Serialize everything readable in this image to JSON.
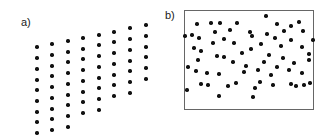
{
  "figure": {
    "width": 326,
    "height": 140,
    "background_color": "#ffffff",
    "dot_color": "#111111",
    "frame_color": "#666666",
    "label_color": "#1a1a1a"
  },
  "panels": {
    "a": {
      "label": "a)",
      "has_frame": false,
      "description": "regular sheared lattice point pattern"
    },
    "b": {
      "label": "b)",
      "has_frame": true,
      "description": "random Poisson point pattern inside rectangular frame"
    }
  },
  "chart_data": [
    {
      "type": "scatter",
      "title": "a)",
      "xlabel": "",
      "ylabel": "",
      "grid": false,
      "legend": null,
      "xlim": [
        0,
        163
      ],
      "ylim": [
        0,
        140
      ],
      "note": "regular lattice, sheared (parallelogram) arrangement, 8 columns x 9 rows clipped",
      "points": [
        [
          37,
          47
        ],
        [
          52,
          44
        ],
        [
          68,
          41
        ],
        [
          83,
          38
        ],
        [
          99,
          35
        ],
        [
          114,
          32
        ],
        [
          130,
          28
        ],
        [
          146,
          25
        ],
        [
          37,
          58
        ],
        [
          52,
          55
        ],
        [
          68,
          52
        ],
        [
          83,
          49
        ],
        [
          99,
          45
        ],
        [
          114,
          42
        ],
        [
          130,
          39
        ],
        [
          146,
          36
        ],
        [
          37,
          69
        ],
        [
          52,
          66
        ],
        [
          68,
          62
        ],
        [
          83,
          59
        ],
        [
          99,
          56
        ],
        [
          114,
          53
        ],
        [
          130,
          50
        ],
        [
          146,
          47
        ],
        [
          37,
          80
        ],
        [
          52,
          76
        ],
        [
          68,
          73
        ],
        [
          83,
          70
        ],
        [
          99,
          67
        ],
        [
          114,
          64
        ],
        [
          130,
          61
        ],
        [
          146,
          57
        ],
        [
          37,
          90
        ],
        [
          52,
          87
        ],
        [
          68,
          84
        ],
        [
          83,
          81
        ],
        [
          99,
          78
        ],
        [
          114,
          75
        ],
        [
          130,
          71
        ],
        [
          146,
          68
        ],
        [
          37,
          101
        ],
        [
          52,
          98
        ],
        [
          68,
          95
        ],
        [
          83,
          92
        ],
        [
          99,
          88
        ],
        [
          114,
          85
        ],
        [
          130,
          82
        ],
        [
          146,
          79
        ],
        [
          37,
          112
        ],
        [
          52,
          109
        ],
        [
          68,
          105
        ],
        [
          83,
          102
        ],
        [
          99,
          99
        ],
        [
          114,
          96
        ],
        [
          130,
          93
        ],
        [
          37,
          122
        ],
        [
          52,
          119
        ],
        [
          68,
          116
        ],
        [
          83,
          113
        ],
        [
          99,
          110
        ],
        [
          37,
          133
        ],
        [
          52,
          130
        ],
        [
          68,
          127
        ]
      ]
    },
    {
      "type": "scatter",
      "title": "b)",
      "xlabel": "",
      "ylabel": "",
      "grid": false,
      "legend": null,
      "xlim": [
        0,
        163
      ],
      "ylim": [
        0,
        140
      ],
      "frame": {
        "x": 21,
        "y": 10,
        "width": 130,
        "height": 100
      },
      "note": "random (Poisson) point pattern, 66 points inside frame",
      "points": [
        [
          34,
          24
        ],
        [
          48,
          23
        ],
        [
          57,
          23
        ],
        [
          74,
          23
        ],
        [
          103,
          16
        ],
        [
          114,
          24
        ],
        [
          128,
          26
        ],
        [
          136,
          22
        ],
        [
          29,
          35
        ],
        [
          52,
          32
        ],
        [
          87,
          32
        ],
        [
          121,
          31
        ],
        [
          140,
          31
        ],
        [
          22,
          36
        ],
        [
          36,
          38
        ],
        [
          61,
          39
        ],
        [
          89,
          36
        ],
        [
          104,
          34
        ],
        [
          112,
          38
        ],
        [
          128,
          40
        ],
        [
          50,
          43
        ],
        [
          71,
          43
        ],
        [
          98,
          44
        ],
        [
          118,
          46
        ],
        [
          139,
          47
        ],
        [
          38,
          51
        ],
        [
          88,
          49
        ],
        [
          54,
          56
        ],
        [
          61,
          57
        ],
        [
          79,
          53
        ],
        [
          146,
          54
        ],
        [
          70,
          62
        ],
        [
          101,
          62
        ],
        [
          120,
          58
        ],
        [
          131,
          63
        ],
        [
          146,
          60
        ],
        [
          33,
          71
        ],
        [
          44,
          73
        ],
        [
          56,
          74
        ],
        [
          81,
          72
        ],
        [
          95,
          70
        ],
        [
          108,
          75
        ],
        [
          126,
          70
        ],
        [
          38,
          84
        ],
        [
          45,
          85
        ],
        [
          65,
          86
        ],
        [
          73,
          83
        ],
        [
          92,
          88
        ],
        [
          110,
          85
        ],
        [
          128,
          84
        ],
        [
          133,
          86
        ],
        [
          141,
          85
        ],
        [
          147,
          83
        ],
        [
          56,
          96
        ],
        [
          90,
          97
        ],
        [
          25,
          67
        ],
        [
          24,
          90
        ],
        [
          35,
          60
        ],
        [
          67,
          30
        ],
        [
          83,
          66
        ],
        [
          97,
          82
        ],
        [
          114,
          67
        ],
        [
          139,
          73
        ],
        [
          150,
          40
        ],
        [
          31,
          48
        ],
        [
          106,
          55
        ]
      ]
    }
  ]
}
